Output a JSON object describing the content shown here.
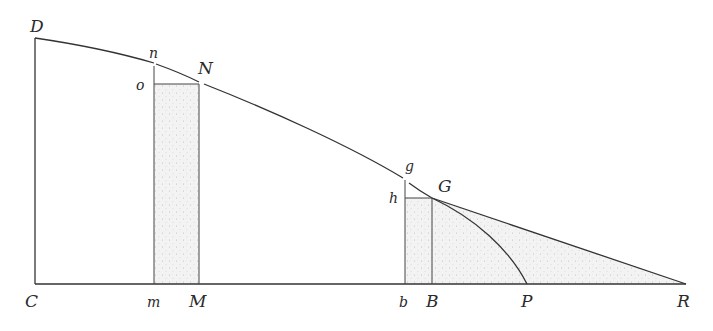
{
  "figure": {
    "type": "geometric-diagram",
    "colors": {
      "line": "#333333",
      "shade": "#e9e9e9",
      "stipple": "#b5b5b5",
      "background": "#ffffff"
    },
    "labels": {
      "C": "C",
      "D": "D",
      "n": "n",
      "o": "o",
      "N": "N",
      "m": "m",
      "M": "M",
      "g": "g",
      "h": "h",
      "G": "G",
      "b": "b",
      "B": "B",
      "P": "P",
      "R": "R"
    },
    "points": {
      "C": [
        35,
        284
      ],
      "D": [
        35,
        38
      ],
      "m": [
        154,
        284
      ],
      "M": [
        199,
        284
      ],
      "n": [
        154,
        65
      ],
      "o": [
        154,
        84
      ],
      "N": [
        199,
        84
      ],
      "b": [
        405,
        284
      ],
      "B": [
        432,
        284
      ],
      "g": [
        405,
        179
      ],
      "h": [
        405,
        198
      ],
      "G": [
        432,
        198
      ],
      "P": [
        527,
        284
      ],
      "R": [
        686,
        284
      ]
    }
  }
}
